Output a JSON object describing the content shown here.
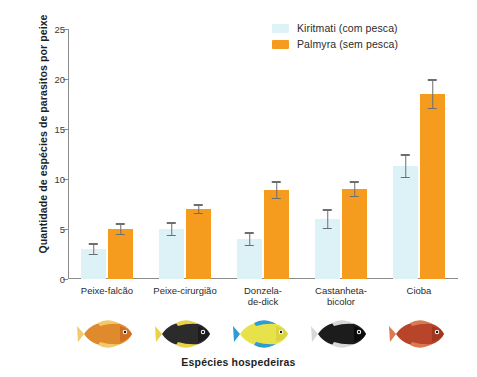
{
  "chart_data": {
    "type": "bar",
    "title": "",
    "xlabel": "Espécies hospedeiras",
    "ylabel": "Quantidade de espécies de parasitos por peixe",
    "ylim": [
      0,
      25
    ],
    "yticks": [
      0,
      5,
      10,
      15,
      20,
      25
    ],
    "grid": false,
    "legend_position": "top-right",
    "categories": [
      "Peixe-falcão",
      "Peixe-cirurgião",
      "Donzela-\nde-dick",
      "Castanheta-\nbicolor",
      "Cioba"
    ],
    "series": [
      {
        "name": "Kiritmati (com pesca)",
        "color": "#ddf2f7",
        "values": [
          3.0,
          5.0,
          4.0,
          6.0,
          11.3
        ],
        "errors": [
          0.6,
          0.7,
          0.7,
          1.0,
          1.2
        ]
      },
      {
        "name": "Palmyra (sem pesca)",
        "color": "#f59c1f",
        "values": [
          5.0,
          7.0,
          8.9,
          9.0,
          18.5
        ],
        "errors": [
          0.6,
          0.5,
          0.9,
          0.8,
          1.5
        ]
      }
    ]
  },
  "legend": {
    "items": [
      {
        "label": "Kiritmati (com pesca)",
        "color": "#ddf2f7"
      },
      {
        "label": "Palmyra (sem pesca)",
        "color": "#f59c1f"
      }
    ]
  },
  "axes": {
    "y_title": "Quantidade de espécies de parasitos por peixe",
    "x_title": "Espécies hospedeiras",
    "y_ticks": [
      "0",
      "5",
      "10",
      "15",
      "20",
      "25"
    ]
  },
  "categories": [
    {
      "line1": "Peixe-falcão",
      "line2": ""
    },
    {
      "line1": "Peixe-cirurgião",
      "line2": ""
    },
    {
      "line1": "Donzela-",
      "line2": "de-dick"
    },
    {
      "line1": "Castanheta-",
      "line2": "bicolor"
    },
    {
      "line1": "Cioba",
      "line2": ""
    }
  ],
  "fish_icons": [
    {
      "name": "hawkfish-image",
      "body": "#e08a2e",
      "fin": "#f2c96b",
      "accent": "#c05a1a"
    },
    {
      "name": "surgeonfish-image",
      "body": "#2b2b2b",
      "fin": "#e8d24a",
      "accent": "#111111"
    },
    {
      "name": "damselfish-image",
      "body": "#e8e24a",
      "fin": "#2e9bd4",
      "accent": "#cfc935"
    },
    {
      "name": "bicolor-chromis-image",
      "body": "#1c1c1c",
      "fin": "#d8d8d8",
      "accent": "#000000"
    },
    {
      "name": "snapper-image",
      "body": "#b8442a",
      "fin": "#d97a52",
      "accent": "#8c2d16"
    }
  ]
}
